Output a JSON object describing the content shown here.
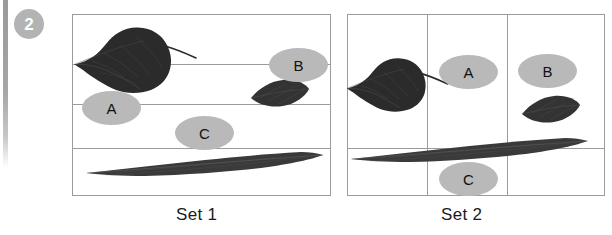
{
  "question": {
    "number": "2"
  },
  "colors": {
    "border": "#9b9b9b",
    "label_fill": "#b9b9b9",
    "badge_fill": "#b3b3b3",
    "leaf_dark": "#2e2e2e",
    "leaf_mid": "#3c3c3c",
    "text": "#111111"
  },
  "sets": [
    {
      "id": "set1",
      "caption": "Set 1",
      "layout": "horizontal-rows",
      "labels": [
        {
          "key": "A",
          "text": "A"
        },
        {
          "key": "B",
          "text": "B"
        },
        {
          "key": "C",
          "text": "C"
        }
      ],
      "specimens": [
        {
          "name": "heart-shaped-leaf",
          "shape": "cordate"
        },
        {
          "name": "small-oval-leaf",
          "shape": "elliptic"
        },
        {
          "name": "long-narrow-leaf",
          "shape": "linear"
        }
      ]
    },
    {
      "id": "set2",
      "caption": "Set 2",
      "layout": "vertical-columns",
      "labels": [
        {
          "key": "A",
          "text": "A"
        },
        {
          "key": "B",
          "text": "B"
        },
        {
          "key": "C",
          "text": "C"
        }
      ],
      "specimens": [
        {
          "name": "heart-shaped-leaf",
          "shape": "cordate"
        },
        {
          "name": "small-oval-leaf",
          "shape": "elliptic"
        },
        {
          "name": "long-narrow-leaf",
          "shape": "linear"
        }
      ]
    }
  ]
}
